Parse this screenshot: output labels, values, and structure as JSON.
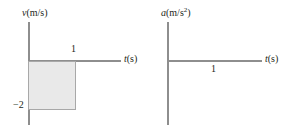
{
  "figure": {
    "background_color": "#ffffff",
    "axis_color": "#8e8e8e",
    "fill_color": "#e9e9e9",
    "fill_border_color": "#a8a8a8",
    "text_color": "#231f20"
  },
  "panels": {
    "velocity": {
      "y_axis_label": "v",
      "y_axis_units": "(m/s)",
      "x_axis_label": "t",
      "x_axis_units": "(s)",
      "ticks": {
        "x_one": "1",
        "y_minus_two": "−2"
      }
    },
    "acceleration": {
      "y_axis_label": "a",
      "y_axis_units_prefix": "(m/s",
      "y_axis_units_exponent": "2",
      "y_axis_units_suffix": ")",
      "x_axis_label": "t",
      "x_axis_units": "(s)",
      "ticks": {
        "x_one": "1"
      }
    }
  },
  "chart_data": [
    {
      "type": "area",
      "title": "",
      "xlabel": "t (s)",
      "ylabel": "v (m/s)",
      "xlim": [
        0,
        2.0
      ],
      "ylim": [
        -2.8,
        0.8
      ],
      "grid": false,
      "legend": "none",
      "x": [
        0,
        1,
        1
      ],
      "values": [
        -2,
        -2,
        0
      ],
      "series": [
        {
          "name": "velocity",
          "x": [
            0,
            1
          ],
          "values": [
            -2,
            -2
          ],
          "description": "constant velocity of -2 m/s from t=0 s to t=1 s, shown as a shaded rectangle between the curve and the t-axis"
        }
      ],
      "xticks": [
        1
      ],
      "xticklabels": [
        "1"
      ],
      "yticks": [
        -2
      ],
      "yticklabels": [
        "−2"
      ],
      "annotations": [
        {
          "text": "shaded rectangle area = displacement = −2 m",
          "x": 0.5,
          "y": -1
        }
      ]
    },
    {
      "type": "line",
      "title": "",
      "xlabel": "t (s)",
      "ylabel": "a (m/s²)",
      "xlim": [
        0,
        2.0
      ],
      "ylim": [
        -2.8,
        0.8
      ],
      "grid": false,
      "legend": "none",
      "series": [
        {
          "name": "acceleration",
          "x": [
            0,
            2.0
          ],
          "values": [
            0,
            0
          ],
          "description": "acceleration is zero for all t, drawn coincident with the t-axis"
        }
      ],
      "xticks": [
        1
      ],
      "xticklabels": [
        "1"
      ],
      "yticks": [],
      "yticklabels": []
    }
  ]
}
